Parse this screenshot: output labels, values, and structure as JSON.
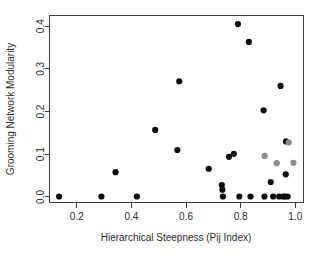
{
  "chart_data": {
    "type": "scatter",
    "title": "",
    "xlabel": "Hierarchical Steepness (Pij Index)",
    "ylabel": "Grooming Network Modularity",
    "xlim": [
      0.1,
      1.03
    ],
    "ylim": [
      -0.013,
      0.425
    ],
    "xticks": [
      0.2,
      0.4,
      0.6,
      0.8,
      1.0
    ],
    "xtick_labels": [
      "0.2",
      "0.4",
      "0.6",
      "0.8",
      "1.0"
    ],
    "yticks": [
      0.0,
      0.1,
      0.2,
      0.3,
      0.4
    ],
    "ytick_labels": [
      "0.0",
      "0.1",
      "0.2",
      "0.3",
      "0.4"
    ],
    "grid": false,
    "legend": "none",
    "marker": "filled-circle",
    "marker_size": 3.1,
    "series": [
      {
        "name": "black-points",
        "color": "#0d0d0d",
        "points": [
          {
            "x": 0.135,
            "y": 0.001
          },
          {
            "x": 0.29,
            "y": 0.001
          },
          {
            "x": 0.342,
            "y": 0.058
          },
          {
            "x": 0.42,
            "y": 0.001
          },
          {
            "x": 0.487,
            "y": 0.157
          },
          {
            "x": 0.568,
            "y": 0.11
          },
          {
            "x": 0.575,
            "y": 0.271
          },
          {
            "x": 0.683,
            "y": 0.066
          },
          {
            "x": 0.731,
            "y": 0.028
          },
          {
            "x": 0.733,
            "y": 0.017
          },
          {
            "x": 0.735,
            "y": 0.001
          },
          {
            "x": 0.757,
            "y": 0.094
          },
          {
            "x": 0.775,
            "y": 0.101
          },
          {
            "x": 0.79,
            "y": 0.405
          },
          {
            "x": 0.795,
            "y": 0.001
          },
          {
            "x": 0.83,
            "y": 0.363
          },
          {
            "x": 0.836,
            "y": 0.001
          },
          {
            "x": 0.884,
            "y": 0.203
          },
          {
            "x": 0.887,
            "y": 0.001
          },
          {
            "x": 0.91,
            "y": 0.035
          },
          {
            "x": 0.919,
            "y": 0.001
          },
          {
            "x": 0.941,
            "y": 0.001
          },
          {
            "x": 0.946,
            "y": 0.26
          },
          {
            "x": 0.955,
            "y": 0.001
          },
          {
            "x": 0.962,
            "y": 0.001
          },
          {
            "x": 0.965,
            "y": 0.053
          },
          {
            "x": 0.966,
            "y": 0.13
          },
          {
            "x": 0.972,
            "y": 0.001
          }
        ]
      },
      {
        "name": "gray-points",
        "color": "#8c8c8c",
        "points": [
          {
            "x": 0.888,
            "y": 0.096
          },
          {
            "x": 0.932,
            "y": 0.079
          },
          {
            "x": 0.976,
            "y": 0.128
          },
          {
            "x": 0.993,
            "y": 0.08
          }
        ]
      }
    ]
  },
  "figure": {
    "frame_color": "#3d3d3d",
    "background": "#ffffff"
  }
}
